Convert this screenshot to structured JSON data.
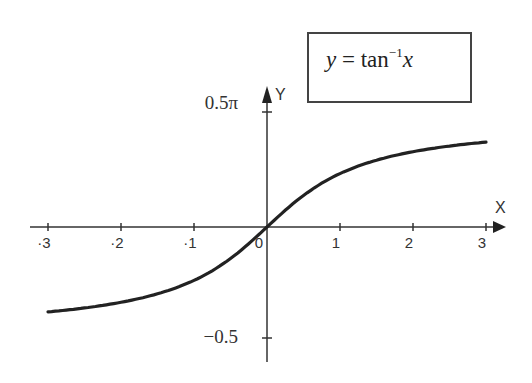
{
  "chart_data": {
    "type": "line",
    "legend": {
      "prefix": "y",
      "equals": " = ",
      "func": "tan",
      "exponent": "−1",
      "var": "x"
    },
    "xlabel": "X",
    "ylabel": "Y",
    "xlim": [
      -3,
      3
    ],
    "ylim": [
      -1.5708,
      1.5708
    ],
    "x_ticks": [
      "-3",
      "-2",
      "-1",
      "0",
      "1",
      "2",
      "3"
    ],
    "y_ticks": [
      {
        "value": 1.5708,
        "label": "0.5π"
      },
      {
        "value": -1.5708,
        "label": "−0.5"
      }
    ],
    "grid": false,
    "series": [
      {
        "name": "y = tan^-1 x",
        "x": [
          -3,
          -2.5,
          -2,
          -1.5,
          -1,
          -0.5,
          0,
          0.5,
          1,
          1.5,
          2,
          2.5,
          3
        ],
        "y": [
          -1.249,
          -1.19,
          -1.107,
          -0.983,
          -0.785,
          -0.464,
          0,
          0.464,
          0.785,
          0.983,
          1.107,
          1.19,
          1.249
        ]
      }
    ]
  },
  "colors": {
    "curve": "#222222",
    "axis": "#333333",
    "background": "#ffffff"
  }
}
